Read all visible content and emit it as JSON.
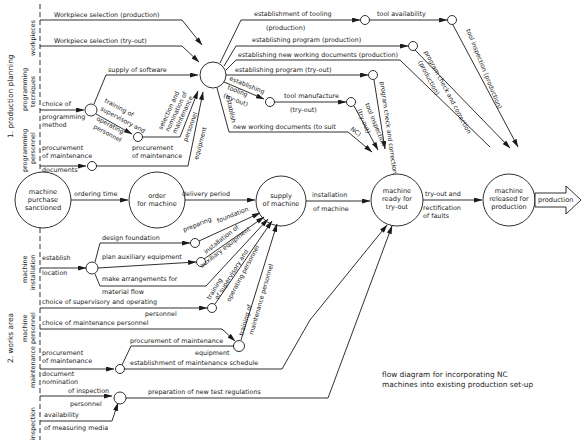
{
  "caption": {
    "line1": "flow diagram for incorporating NC",
    "line2": "machines into existing production set-up"
  },
  "sections": {
    "production_planning": "1. production planning",
    "works_area": "2. works area"
  },
  "categories": {
    "workpieces": "workpieces",
    "programming_techniques_1": "programming",
    "programming_techniques_2": "tecniques",
    "programming_personnel_1": "programming",
    "programming_personnel_2": "personnel",
    "machine_installation_1": "machine",
    "machine_installation_2": "installation",
    "machine_personnel_1": "machine",
    "machine_personnel_2": "personnel",
    "maintenance": "maintenance",
    "inspection": "inspection"
  },
  "main_nodes": {
    "purchase": [
      "machine",
      "purchase",
      "sanctioned"
    ],
    "order": [
      "order",
      "for machine"
    ],
    "supply": [
      "supply",
      "of machine"
    ],
    "ready": [
      "machine",
      "ready for",
      "try-out"
    ],
    "released": [
      "machine",
      "released for",
      "production"
    ],
    "output_arrow": "production"
  },
  "edges": {
    "workpiece_production": "Workpiece selection (production)",
    "workpiece_tryout": "Workpiece selection (try-out)",
    "supply_software": "supply of software",
    "choice_of": "choice of",
    "programming_method_1": "programming",
    "programming_method_2": "method",
    "training_sup_1": "training of",
    "training_sup_2": "supervisory and",
    "operating_1": "operating",
    "operating_2": "personnel",
    "selection_1": "selection and",
    "selection_2": "nomination of",
    "selection_3": "maintenance",
    "selection_4": "personnel",
    "procurement_doc_1": "procurement",
    "procurement_doc_2": "of maintenance",
    "procurement_doc_3": "documents",
    "procurement_eq_1": "procurement",
    "procurement_eq_2": "of maintenance",
    "procurement_eq_3": "equipment",
    "est_tooling_prod": "establishment of tooling",
    "est_tooling_prod_2": "(production)",
    "tool_availability": "tool availability",
    "est_program_prod": "establishing program (production)",
    "est_new_docs_prod": "establishing new working documents (production)",
    "est_program_tryout": "establishing program (try-out)",
    "est_tooling_tryout_1": "establishing",
    "est_tooling_tryout_2": "tooling",
    "est_tooling_tryout_3": "(try-out)",
    "tool_manufacture": "tool manufacture",
    "tool_manufacture_2": "(try-out)",
    "establish": "establish",
    "new_docs_nc": "new working documents (to suit",
    "new_docs_nc_2": "NC)",
    "tool_insp_tryout_1": "tool inspection",
    "tool_insp_tryout_2": "(try-out)",
    "prog_check_tryout": "program check and correction",
    "prog_check_prod_1": "program check and correction",
    "prog_check_prod_2": "(production)",
    "tool_insp_prod": "tool inspection (production)",
    "ordering_time": "ordering time",
    "delivery_period": "delivery period",
    "installation_1": "installation",
    "installation_2": "of machine",
    "tryout_1": "try-out and",
    "tryout_2": "rectification",
    "tryout_3": "of faults",
    "design_foundation": "design foundation",
    "preparing_foundation_1": "preparing",
    "preparing_foundation_2": "foundation",
    "establish_location_1": "establish",
    "establish_location_2": "location",
    "plan_aux": "plan auxiliary equipment",
    "install_aux_1": "installation of",
    "install_aux_2": "auxiliary equipment",
    "material_flow_1": "make arrangements for",
    "material_flow_2": "material flow",
    "training_op_1": "training",
    "training_op_2": "of supervisory and",
    "training_op_3": "operating personnel",
    "choice_sup_1": "choice of supervisory and operating",
    "choice_sup_2": "personnel",
    "choice_maint": "choice of maintenance personnel",
    "training_maint_1": "training of",
    "training_maint_2": "maintenance personnel",
    "maint_proc_1": "procurement",
    "maint_proc_2": "of maintenance",
    "maint_proc_3": "document",
    "proc_maint_eq_1": "procurement of maintenance",
    "proc_maint_eq_2": "equipment",
    "maint_schedule": "establishment of maintenance schedule",
    "nomination_1": "nomination",
    "nomination_2": "of inspection",
    "nomination_3": "personnel",
    "availability_1": "availability",
    "availability_2": "of measuring media",
    "test_regulations": "preparation of new test regulations"
  }
}
